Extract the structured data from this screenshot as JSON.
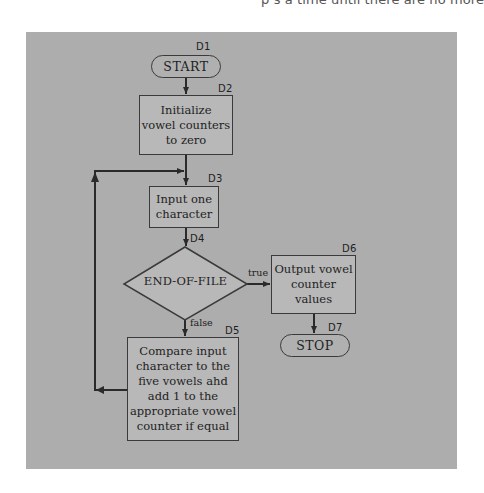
{
  "page": {
    "top_text_fragment": "p  s a time until there are no more"
  },
  "flowchart": {
    "nodes": {
      "d1": {
        "id": "D1",
        "type": "terminal",
        "text": "START"
      },
      "d2": {
        "id": "D2",
        "type": "process",
        "text": "Initialize vowel counters to zero",
        "lines": [
          "Initialize",
          "vowel counters",
          "to zero"
        ]
      },
      "d3": {
        "id": "D3",
        "type": "process",
        "text": "Input one character",
        "lines": [
          "Input one",
          "character"
        ]
      },
      "d4": {
        "id": "D4",
        "type": "decision",
        "text": "END-OF-FILE"
      },
      "d5": {
        "id": "D5",
        "type": "process",
        "text": "Compare input character to the five vowels ahd add 1 to the appropriate vowel counter if equal",
        "lines": [
          "Compare input",
          "character to the",
          "five vowels ahd",
          "add 1 to the",
          "appropriate vowel",
          "counter if equal"
        ]
      },
      "d6": {
        "id": "D6",
        "type": "process",
        "text": "Output vowel counter values",
        "lines": [
          "Output vowel",
          "counter",
          "values"
        ]
      },
      "d7": {
        "id": "D7",
        "type": "terminal",
        "text": "STOP"
      }
    },
    "edges": [
      {
        "from": "D1",
        "to": "D2",
        "label": ""
      },
      {
        "from": "D2",
        "to": "D3",
        "label": ""
      },
      {
        "from": "D3",
        "to": "D4",
        "label": ""
      },
      {
        "from": "D4",
        "to": "D6",
        "label": "true"
      },
      {
        "from": "D4",
        "to": "D5",
        "label": "false"
      },
      {
        "from": "D5",
        "to": "D3",
        "label": ""
      },
      {
        "from": "D6",
        "to": "D7",
        "label": ""
      }
    ],
    "edge_labels": {
      "true": "true",
      "false": "false"
    }
  },
  "colors": {
    "panel": "#adadad",
    "stroke": "#3a3a3a",
    "text": "#1e1e1e"
  }
}
